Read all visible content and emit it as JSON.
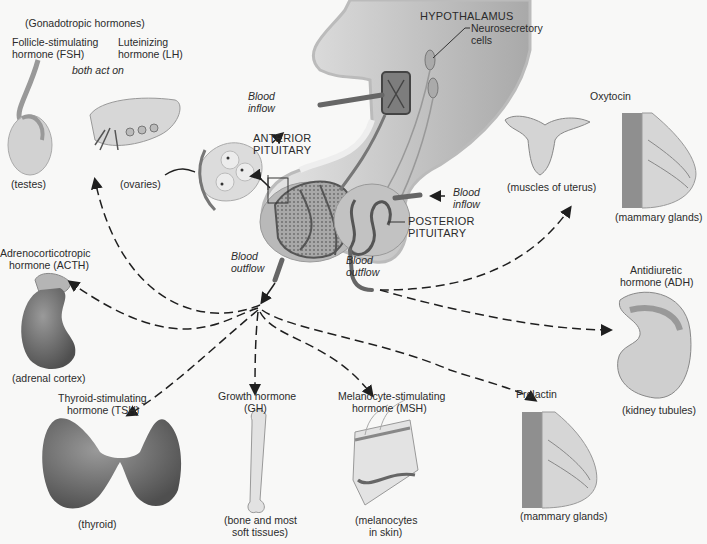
{
  "diagram": {
    "structures": {
      "hypothalamus": "HYPOTHALAMUS",
      "neurosecretory": [
        "Neurosecretory",
        "cells"
      ],
      "anterior_pituitary": [
        "ANTERIOR",
        "PITUITARY"
      ],
      "posterior_pituitary": [
        "POSTERIOR",
        "PITUITARY"
      ],
      "blood_inflow_top": [
        "Blood",
        "inflow"
      ],
      "blood_inflow_right": [
        "Blood",
        "inflow"
      ],
      "blood_outflow_left": [
        "Blood",
        "outflow"
      ],
      "blood_outflow_right": [
        "Blood",
        "outflow"
      ]
    },
    "hormones": {
      "gonadotropic": {
        "group": "(Gonadotropic hormones)",
        "fsh": [
          "Follicle-stimulating",
          "hormone (FSH)"
        ],
        "lh": [
          "Luteinizing",
          "hormone (LH)"
        ],
        "note": "both act on",
        "targets": [
          "(testes)",
          "(ovaries)"
        ]
      },
      "acth": {
        "name": [
          "Adrenocorticotropic",
          "hormone (ACTH)"
        ],
        "target": "(adrenal cortex)"
      },
      "tsh": {
        "name": [
          "Thyroid-stimulating",
          "hormone (TSH)"
        ],
        "target": "(thyroid)"
      },
      "gh": {
        "name": [
          "Growth hormone",
          "(GH)"
        ],
        "target": [
          "(bone and most",
          "soft tissues)"
        ]
      },
      "msh": {
        "name": [
          "Melanocyte-stimulating",
          "hormone (MSH)"
        ],
        "target": [
          "(melanocytes",
          "in skin)"
        ]
      },
      "prolactin": {
        "name": "Prolactin",
        "target": "(mammary glands)"
      },
      "oxytocin": {
        "name": "Oxytocin",
        "targets": [
          "(muscles of uterus)",
          "(mammary glands)"
        ]
      },
      "adh": {
        "name": [
          "Antidiuretic",
          "hormone (ADH)"
        ],
        "target": "(kidney tubules)"
      }
    },
    "colors": {
      "background": "#f8f8f7",
      "tissue_light": "#c9c9c9",
      "tissue_dark": "#8a8a8a",
      "organ_dark": "#6e6e6e",
      "arrow": "#1f1f1f",
      "text": "#2b2b2b"
    }
  }
}
